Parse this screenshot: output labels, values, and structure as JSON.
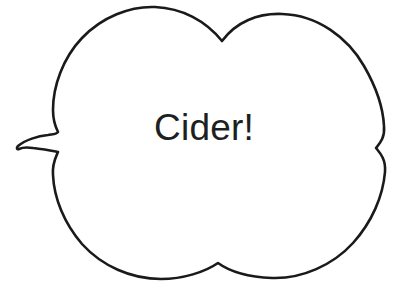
{
  "canvas": {
    "width": 408,
    "height": 294,
    "background_color": "#ffffff"
  },
  "bubble": {
    "name": "speech-bubble",
    "shape": "cloud-callout",
    "tail_direction": "left",
    "outline_color": "#1a1a1a",
    "fill_color": "#ffffff",
    "stroke_width": 2.6
  },
  "text": {
    "content": "Cider!",
    "color": "#201f1f",
    "font_size_px": 37,
    "align": "center"
  }
}
